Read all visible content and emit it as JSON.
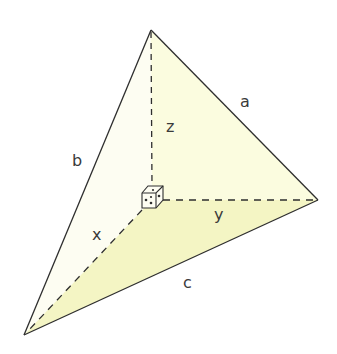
{
  "diagram": {
    "type": "tetrahedron-right-corner",
    "vertices": {
      "apex": [
        151,
        30
      ],
      "right": [
        318,
        200
      ],
      "bottom_left": [
        24,
        335
      ],
      "origin": [
        152,
        200
      ]
    },
    "colors": {
      "stroke": "#2e2e2e",
      "face_left": "#fdfdf2",
      "face_right": "#fbfcdf",
      "face_bottom": "#f4f5c4"
    },
    "labels": {
      "a": "a",
      "b": "b",
      "c": "c",
      "x": "x",
      "y": "y",
      "z": "z"
    },
    "right_angle_marker": "cube-corner"
  }
}
